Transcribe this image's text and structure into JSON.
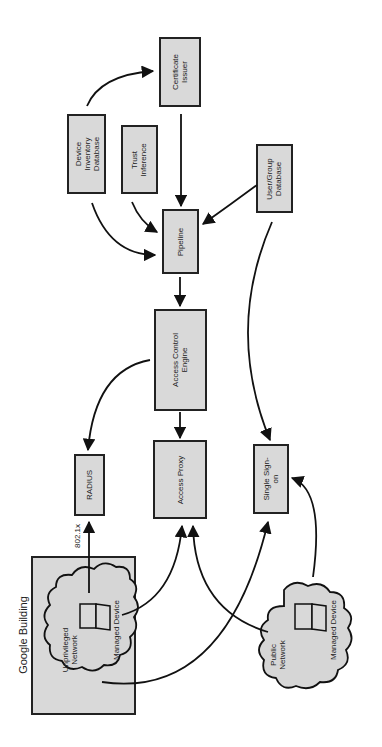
{
  "diagram": {
    "orientation": "rotated-90-ccw",
    "nodes": {
      "certificate_issuer": {
        "line1": "Certificate",
        "line2": "Issuer"
      },
      "device_inventory": {
        "line1": "Device",
        "line2": "Inventory",
        "line3": "Database"
      },
      "trust_inference": {
        "line1": "Trust",
        "line2": "Inference"
      },
      "user_group_db": {
        "line1": "User/Group",
        "line2": "Database"
      },
      "pipeline": {
        "label": "Pipeline"
      },
      "access_control_engine": {
        "line1": "Access Control",
        "line2": "Engine"
      },
      "radius": {
        "label": "RADIUS"
      },
      "access_proxy": {
        "label": "Access Proxy"
      },
      "single_sign_on": {
        "line1": "Single Sign-",
        "line2": "on"
      },
      "google_building": {
        "label": "Google Building"
      },
      "unprivileged_network": {
        "line1": "Unprivileged",
        "line2": "Network"
      },
      "managed_device_internal": {
        "label": "Managed Device"
      },
      "public_network": {
        "line1": "Public",
        "line2": "Network"
      },
      "managed_device_external": {
        "label": "Managed Device"
      }
    },
    "edge_labels": {
      "dot1x": "802.1x"
    },
    "edges": [
      {
        "from": "Device Inventory Database",
        "to": "Certificate Issuer"
      },
      {
        "from": "Certificate Issuer",
        "to": "Pipeline"
      },
      {
        "from": "Device Inventory Database",
        "to": "Pipeline"
      },
      {
        "from": "Trust Inference",
        "to": "Pipeline"
      },
      {
        "from": "User/Group Database",
        "to": "Pipeline"
      },
      {
        "from": "User/Group Database",
        "to": "Single Sign-on"
      },
      {
        "from": "Pipeline",
        "to": "Access Control Engine"
      },
      {
        "from": "Access Control Engine",
        "to": "RADIUS"
      },
      {
        "from": "Access Control Engine",
        "to": "Access Proxy"
      },
      {
        "from": "Managed Device (Unprivileged Network)",
        "to": "RADIUS",
        "label": "802.1x"
      },
      {
        "from": "Managed Device (Unprivileged Network)",
        "to": "Access Proxy"
      },
      {
        "from": "Unprivileged Network",
        "to": "Single Sign-on"
      },
      {
        "from": "Public Network",
        "to": "Access Proxy"
      },
      {
        "from": "Managed Device (Public Network)",
        "to": "Single Sign-on"
      }
    ]
  }
}
